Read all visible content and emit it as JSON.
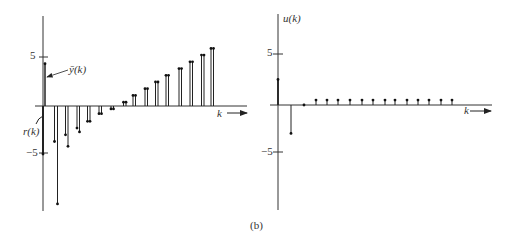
{
  "caption": "(b)",
  "chart_data": [
    {
      "type": "stem",
      "panel": "left",
      "title": "",
      "xlabel": "k",
      "ylabel": "",
      "yticks": [
        5,
        -5
      ],
      "ytick_labels": [
        "5",
        "−5"
      ],
      "ylim": [
        -11,
        9
      ],
      "annotations": [
        "ȳ(k)",
        "r(k)"
      ],
      "x": [
        0,
        1,
        2,
        3,
        4,
        5,
        6,
        7,
        8,
        9,
        10,
        11,
        12,
        13,
        14,
        15
      ],
      "series": [
        {
          "name": "r(k)",
          "values": [
            -5,
            -3.7,
            -3.0,
            -2.3,
            -1.6,
            -0.8,
            -0.3,
            0.4,
            1.1,
            1.8,
            2.5,
            3.2,
            3.9,
            4.6,
            5.3,
            6.0
          ]
        },
        {
          "name": "ȳ(k)",
          "values": [
            4.4,
            -10.2,
            -4.2,
            -2.7,
            -1.6,
            -0.8,
            -0.3,
            0.4,
            1.1,
            1.8,
            2.5,
            3.2,
            3.9,
            4.6,
            5.3,
            6.0
          ]
        }
      ]
    },
    {
      "type": "stem",
      "panel": "right",
      "title": "",
      "xlabel": "k",
      "ylabel": "u(k)",
      "yticks": [
        5,
        -5
      ],
      "ytick_labels": [
        "5",
        "−5"
      ],
      "ylim": [
        -11,
        9
      ],
      "x": [
        0,
        1,
        2,
        3,
        4,
        5,
        6,
        7,
        8,
        9,
        10,
        11,
        12,
        13,
        14,
        15
      ],
      "series": [
        {
          "name": "u(k)",
          "values": [
            2.6,
            -2.9,
            0,
            0.5,
            0.5,
            0.5,
            0.5,
            0.5,
            0.5,
            0.5,
            0.5,
            0.5,
            0.5,
            0.5,
            0.5,
            0.5
          ]
        }
      ]
    }
  ],
  "left": {
    "tick_pos": "5",
    "tick_neg": "−5",
    "ybar_label": "ȳ(k)",
    "r_label": "r(k)",
    "k_label": "k"
  },
  "right": {
    "tick_pos": "5",
    "tick_neg": "−5",
    "u_label": "u(k)",
    "k_label": "k"
  }
}
